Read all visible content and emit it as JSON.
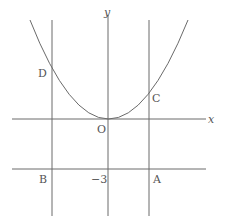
{
  "diagram": {
    "type": "coordinate-graph",
    "axes": {
      "x_label": "x",
      "y_label": "y",
      "origin_label": "O"
    },
    "curve": {
      "kind": "parabola",
      "vertex": "O",
      "opens": "up"
    },
    "points": [
      {
        "name": "D",
        "position": "intersection of parabola and left vertical line"
      },
      {
        "name": "C",
        "position": "intersection of parabola and right vertical line"
      },
      {
        "name": "B",
        "position": "intersection of left vertical line and line y = -3"
      },
      {
        "name": "A",
        "position": "intersection of right vertical line and line y = -3"
      }
    ],
    "labels": {
      "x_axis": "x",
      "y_axis": "y",
      "origin": "O",
      "D": "D",
      "C": "C",
      "B": "B",
      "A": "A",
      "y_intercept_line": "−3"
    },
    "lines": [
      {
        "name": "left-vertical",
        "passes_through": [
          "D",
          "B"
        ]
      },
      {
        "name": "right-vertical",
        "passes_through": [
          "C",
          "A"
        ]
      },
      {
        "name": "horizontal-y-minus-3",
        "equation": "y = -3",
        "passes_through": [
          "B",
          "A"
        ]
      }
    ]
  }
}
